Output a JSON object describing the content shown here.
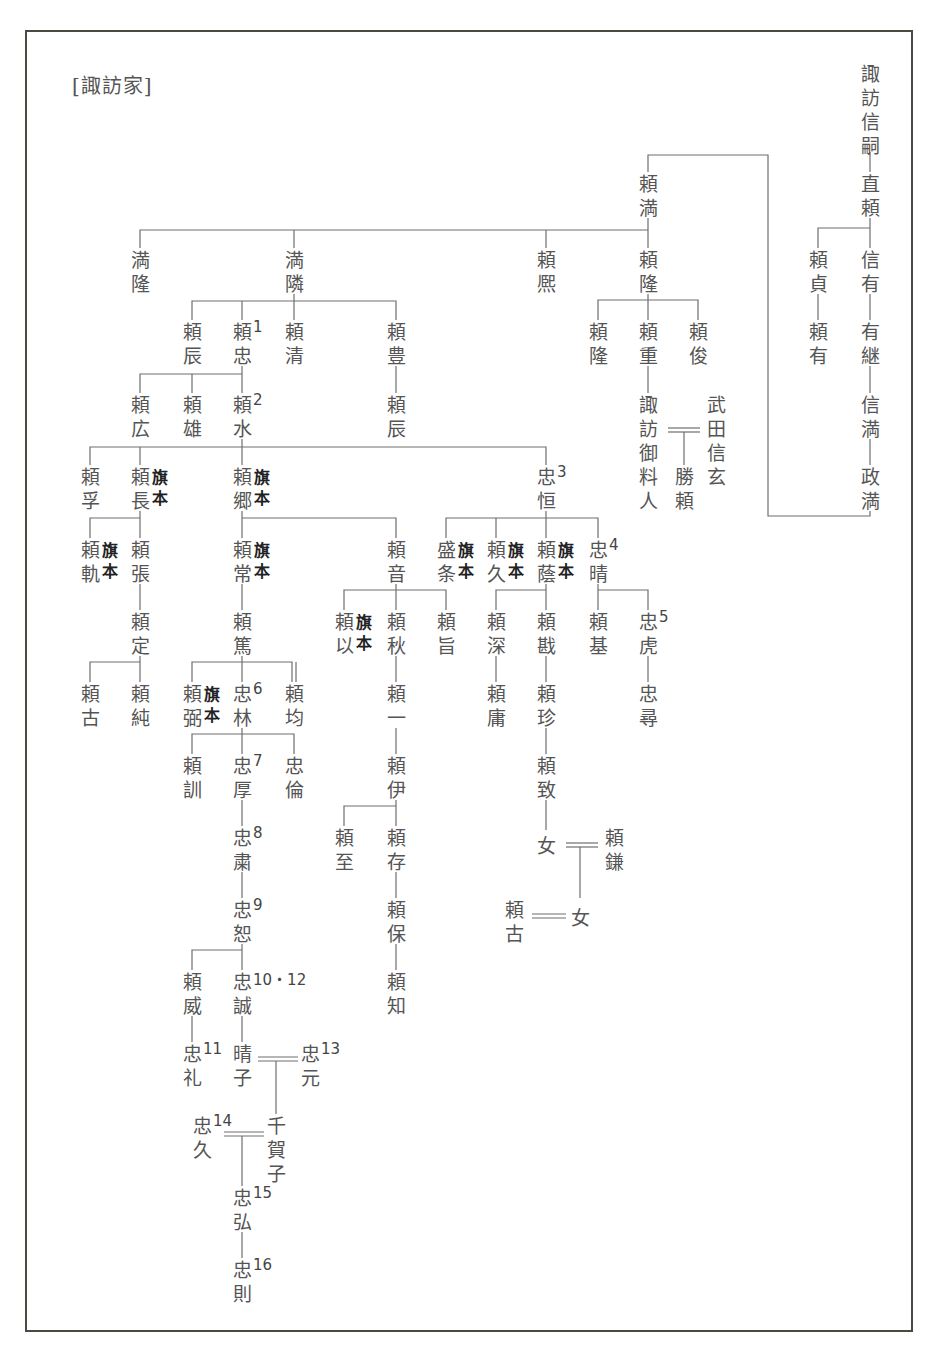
{
  "title": "[諏訪家]",
  "hatamoto_label": "旗本",
  "nodes": [
    {
      "id": "nobutsugu",
      "name": "諏訪信嗣",
      "x": 870,
      "y": 62
    },
    {
      "id": "naoyori",
      "name": "直頼",
      "x": 870,
      "y": 172
    },
    {
      "id": "yorisada",
      "name": "頼貞",
      "x": 818,
      "y": 248
    },
    {
      "id": "nobuari",
      "name": "信有",
      "x": 870,
      "y": 248
    },
    {
      "id": "yoriari",
      "name": "頼有",
      "x": 818,
      "y": 320
    },
    {
      "id": "aritsugu",
      "name": "有継",
      "x": 870,
      "y": 320
    },
    {
      "id": "nobumitsu",
      "name": "信満",
      "x": 870,
      "y": 393
    },
    {
      "id": "masamitsu",
      "name": "政満",
      "x": 870,
      "y": 465
    },
    {
      "id": "yorimitsu",
      "name": "頼満",
      "x": 648,
      "y": 172
    },
    {
      "id": "mitsutaka",
      "name": "満隆",
      "x": 140,
      "y": 248
    },
    {
      "id": "mitsuchika",
      "name": "満隣",
      "x": 294,
      "y": 248
    },
    {
      "id": "yorihiro",
      "name": "頼熈",
      "x": 546,
      "y": 248
    },
    {
      "id": "yoritaka",
      "name": "頼隆",
      "x": 648,
      "y": 248
    },
    {
      "id": "yoritaka2",
      "name": "頼隆",
      "x": 598,
      "y": 320
    },
    {
      "id": "yorishige",
      "name": "頼重",
      "x": 648,
      "y": 320
    },
    {
      "id": "yoritoshi",
      "name": "頼俊",
      "x": 698,
      "y": 320
    },
    {
      "id": "goryonin",
      "name": "諏訪御料人",
      "x": 648,
      "y": 393
    },
    {
      "id": "shingen",
      "name": "武田信玄",
      "x": 716,
      "y": 393
    },
    {
      "id": "katsuyori",
      "name": "勝頼",
      "x": 684,
      "y": 465
    },
    {
      "id": "yoritoki",
      "name": "頼辰",
      "x": 192,
      "y": 320
    },
    {
      "id": "yoritada",
      "name": "頼忠",
      "x": 242,
      "y": 320,
      "num": "1"
    },
    {
      "id": "yorikiyo",
      "name": "頼清",
      "x": 294,
      "y": 320
    },
    {
      "id": "yoritoyo",
      "name": "頼豊",
      "x": 396,
      "y": 320
    },
    {
      "id": "yorihiro2",
      "name": "頼広",
      "x": 140,
      "y": 393
    },
    {
      "id": "yorikatsu",
      "name": "頼雄",
      "x": 192,
      "y": 393
    },
    {
      "id": "yoromizu",
      "name": "頼水",
      "x": 242,
      "y": 393,
      "num": "2"
    },
    {
      "id": "yoritoki2",
      "name": "頼辰",
      "x": 396,
      "y": 393
    },
    {
      "id": "yorisuke",
      "name": "頼孚",
      "x": 90,
      "y": 465
    },
    {
      "id": "yorinaga",
      "name": "頼長",
      "x": 140,
      "y": 465,
      "hatamoto": true
    },
    {
      "id": "yorisato",
      "name": "頼郷",
      "x": 242,
      "y": 465,
      "hatamoto": true
    },
    {
      "id": "tadatsune",
      "name": "忠恒",
      "x": 546,
      "y": 465,
      "num": "3"
    },
    {
      "id": "yorinori",
      "name": "頼軌",
      "x": 90,
      "y": 538,
      "hatamoto": true
    },
    {
      "id": "yoriharu",
      "name": "頼張",
      "x": 140,
      "y": 538
    },
    {
      "id": "yoritsune",
      "name": "頼常",
      "x": 242,
      "y": 538,
      "hatamoto": true
    },
    {
      "id": "yorine",
      "name": "頼音",
      "x": 396,
      "y": 538
    },
    {
      "id": "morieda",
      "name": "盛条",
      "x": 446,
      "y": 538,
      "hatamoto": true
    },
    {
      "id": "yorihisa",
      "name": "頼久",
      "x": 496,
      "y": 538,
      "hatamoto": true
    },
    {
      "id": "yorifuji",
      "name": "頼蔭",
      "x": 546,
      "y": 538,
      "hatamoto": true
    },
    {
      "id": "tadaharu",
      "name": "忠晴",
      "x": 598,
      "y": 538,
      "num": "4"
    },
    {
      "id": "yorisada2",
      "name": "頼定",
      "x": 140,
      "y": 610
    },
    {
      "id": "yoriatsu",
      "name": "頼篤",
      "x": 242,
      "y": 610
    },
    {
      "id": "yorimochi",
      "name": "頼以",
      "x": 344,
      "y": 610,
      "hatamoto": true
    },
    {
      "id": "yoriaki",
      "name": "頼秋",
      "x": 396,
      "y": 610
    },
    {
      "id": "yorimune",
      "name": "頼旨",
      "x": 446,
      "y": 610
    },
    {
      "id": "yorifuka",
      "name": "頼深",
      "x": 496,
      "y": 610
    },
    {
      "id": "yorikiri",
      "name": "頼戡",
      "x": 546,
      "y": 610
    },
    {
      "id": "yorimoto",
      "name": "頼基",
      "x": 598,
      "y": 610
    },
    {
      "id": "tadatora",
      "name": "忠虎",
      "x": 648,
      "y": 610,
      "num": "5"
    },
    {
      "id": "yorifuru",
      "name": "頼古",
      "x": 90,
      "y": 682
    },
    {
      "id": "yorijun",
      "name": "頼純",
      "x": 140,
      "y": 682
    },
    {
      "id": "yoriyowa",
      "name": "頼弼",
      "x": 192,
      "y": 682,
      "hatamoto": true
    },
    {
      "id": "tadatoki",
      "name": "忠林",
      "x": 242,
      "y": 682,
      "num": "6"
    },
    {
      "id": "yorihitoshi",
      "name": "頼均",
      "x": 294,
      "y": 682
    },
    {
      "id": "yoriichi",
      "name": "頼一",
      "x": 396,
      "y": 682
    },
    {
      "id": "yoriyasu",
      "name": "頼庸",
      "x": 496,
      "y": 682
    },
    {
      "id": "yorichin",
      "name": "頼珍",
      "x": 546,
      "y": 682
    },
    {
      "id": "tadahiro",
      "name": "忠尋",
      "x": 648,
      "y": 682
    },
    {
      "id": "yorikun",
      "name": "頼訓",
      "x": 192,
      "y": 754
    },
    {
      "id": "tadaatsu",
      "name": "忠厚",
      "x": 242,
      "y": 754,
      "num": "7"
    },
    {
      "id": "tadatomo",
      "name": "忠倫",
      "x": 294,
      "y": 754
    },
    {
      "id": "yoritada2",
      "name": "頼伊",
      "x": 396,
      "y": 754
    },
    {
      "id": "yorimune2",
      "name": "頼致",
      "x": 546,
      "y": 754
    },
    {
      "id": "yorimichi",
      "name": "頼至",
      "x": 344,
      "y": 826
    },
    {
      "id": "yoriari2",
      "name": "頼存",
      "x": 396,
      "y": 826
    },
    {
      "id": "onna1",
      "name": "女",
      "x": 546,
      "y": 834
    },
    {
      "id": "yorikane",
      "name": "頼鎌",
      "x": 614,
      "y": 826
    },
    {
      "id": "tadakiyo",
      "name": "忠粛",
      "x": 242,
      "y": 826,
      "num": "8"
    },
    {
      "id": "yoriyasu2",
      "name": "頼保",
      "x": 396,
      "y": 898
    },
    {
      "id": "yorifuru2",
      "name": "頼古",
      "x": 514,
      "y": 898
    },
    {
      "id": "onna2",
      "name": "女",
      "x": 580,
      "y": 906
    },
    {
      "id": "tadamichi",
      "name": "忠恕",
      "x": 242,
      "y": 898,
      "num": "9"
    },
    {
      "id": "yoritake",
      "name": "頼威",
      "x": 192,
      "y": 970
    },
    {
      "id": "tadamakoto",
      "name": "忠誠",
      "x": 242,
      "y": 970,
      "num": "10・12"
    },
    {
      "id": "yoritomo",
      "name": "頼知",
      "x": 396,
      "y": 970
    },
    {
      "id": "tadaaya",
      "name": "忠礼",
      "x": 192,
      "y": 1042,
      "num": "11"
    },
    {
      "id": "haruko",
      "name": "晴子",
      "x": 242,
      "y": 1042
    },
    {
      "id": "tadamoto",
      "name": "忠元",
      "x": 310,
      "y": 1042,
      "num": "13"
    },
    {
      "id": "tadahisa",
      "name": "忠久",
      "x": 202,
      "y": 1114,
      "num": "14",
      "num_left": true
    },
    {
      "id": "chikako",
      "name": "千賀子",
      "x": 276,
      "y": 1114
    },
    {
      "id": "tadahiro2",
      "name": "忠弘",
      "x": 242,
      "y": 1186,
      "num": "15"
    },
    {
      "id": "tadanori",
      "name": "忠則",
      "x": 242,
      "y": 1258,
      "num": "16"
    }
  ]
}
